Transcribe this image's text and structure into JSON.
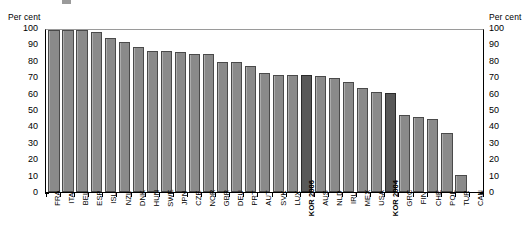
{
  "axis_titles": {
    "left": "Per cent",
    "right": "Per cent"
  },
  "y_ticks": [
    "0",
    "10",
    "20",
    "30",
    "40",
    "50",
    "60",
    "70",
    "80",
    "90",
    "100"
  ],
  "colors": {
    "bar": "#8a8a8a",
    "bar_highlight": "#585858",
    "bar_edge": "#4a4a4a",
    "axis": "#000000",
    "gridline_top": "#9a9a9a",
    "background": "#ffffff"
  },
  "chart_data": {
    "type": "bar",
    "title": "",
    "xlabel": "",
    "ylabel": "Per cent",
    "ylim": [
      0,
      100
    ],
    "ytick_step": 10,
    "grid": false,
    "legend": "none",
    "highlighted": [
      "KOR 2006",
      "KOR 2004"
    ],
    "categories": [
      "FRA",
      "ITA",
      "BEL",
      "ESP",
      "ISL",
      "NZL",
      "DNK",
      "HUN",
      "SWE",
      "JPN",
      "CZE",
      "NOR",
      "GBR",
      "DEU",
      "PRT",
      "AUT",
      "SVK",
      "LUX",
      "KOR 2006",
      "AUS",
      "NLD",
      "IRL",
      "MEX",
      "USA",
      "KOR 2004",
      "GRC",
      "FIN",
      "CHE",
      "POL",
      "TUR",
      "CAN"
    ],
    "values": [
      100,
      100,
      100,
      99,
      95,
      92.5,
      89.5,
      87,
      87,
      86.5,
      85.5,
      85,
      80.5,
      80.5,
      78,
      73.5,
      72.5,
      72.5,
      72.5,
      71.5,
      70.5,
      68,
      64.5,
      62,
      61,
      47.5,
      46,
      45,
      36.5,
      10.5,
      0
    ]
  }
}
